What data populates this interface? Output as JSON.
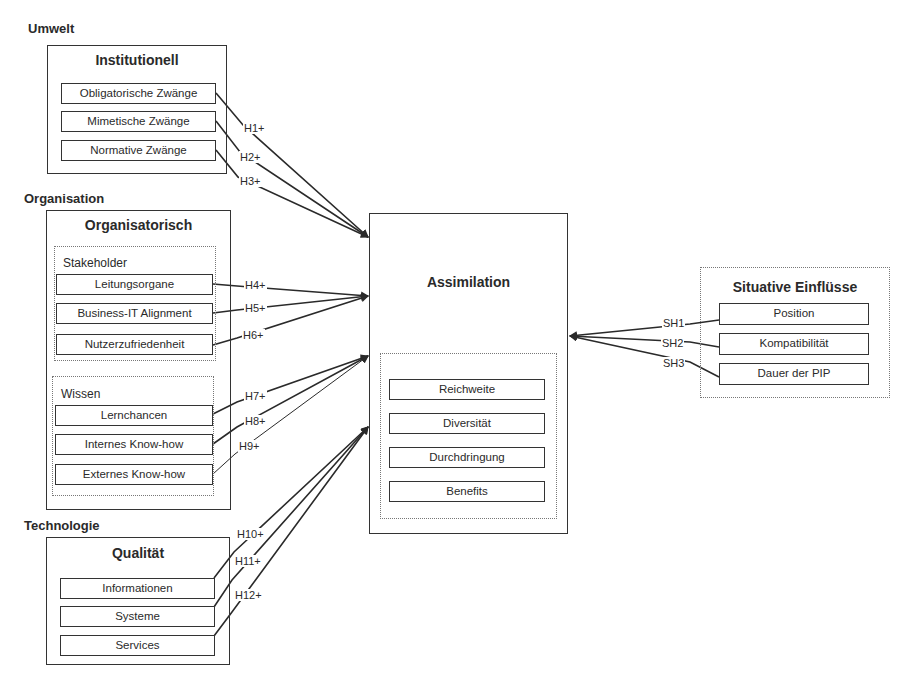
{
  "sections": {
    "umwelt": "Umwelt",
    "organisation": "Organisation",
    "technologie": "Technologie"
  },
  "institutionell": {
    "title": "Institutionell",
    "items": [
      "Obligatorische Zwänge",
      "Mimetische Zwänge",
      "Normative Zwänge"
    ]
  },
  "organisatorisch": {
    "title": "Organisatorisch",
    "stakeholder": {
      "label": "Stakeholder",
      "items": [
        "Leitungsorgane",
        "Business-IT Alignment",
        "Nutzerzufriedenheit"
      ]
    },
    "wissen": {
      "label": "Wissen",
      "items": [
        "Lernchancen",
        "Internes Know-how",
        "Externes Know-how"
      ]
    }
  },
  "qualitaet": {
    "title": "Qualität",
    "items": [
      "Informationen",
      "Systeme",
      "Services"
    ]
  },
  "assimilation": {
    "title": "Assimilation",
    "items": [
      "Reichweite",
      "Diversität",
      "Durchdringung",
      "Benefits"
    ]
  },
  "situative": {
    "title": "Situative Einflüsse",
    "items": [
      "Position",
      "Kompatibilität",
      "Dauer der PIP"
    ]
  },
  "hypotheses": [
    "H1+",
    "H2+",
    "H3+",
    "H4+",
    "H5+",
    "H6+",
    "H7+",
    "H8+",
    "H9+",
    "H10+",
    "H11+",
    "H12+"
  ],
  "situative_hypotheses": [
    "SH1",
    "SH2",
    "SH3"
  ],
  "colors": {
    "line": "#2a2a2a",
    "text": "#2a2a2a",
    "background": "#ffffff"
  }
}
